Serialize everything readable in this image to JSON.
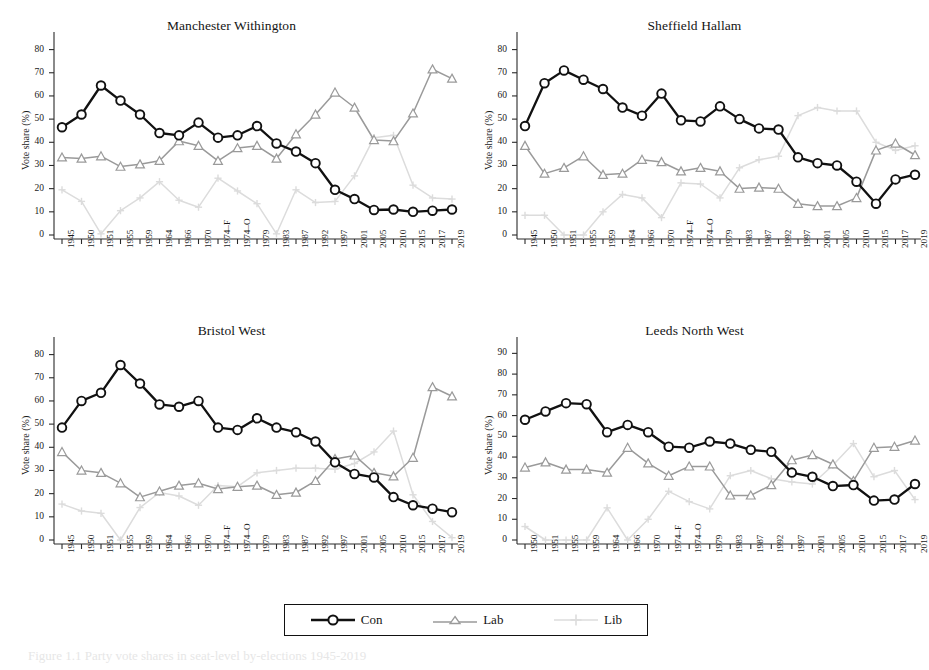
{
  "figure": {
    "caption": "Figure 1.1   Party vote shares in seat-level by-elections 1945-2019",
    "ylabel": "Vote share (%)"
  },
  "legend": {
    "position": "bottom-center",
    "entries": [
      {
        "label": "Con",
        "color": "#111111",
        "marker": "circle"
      },
      {
        "label": "Lab",
        "color": "#9a9a9a",
        "marker": "triangle"
      },
      {
        "label": "Lib",
        "color": "#dcdcdc",
        "marker": "plus"
      }
    ]
  },
  "chart_data": [
    {
      "type": "line",
      "title": "Manchester Withington",
      "xlabel": "",
      "ylabel": "Vote share (%)",
      "ylim": [
        0,
        85
      ],
      "yticks": [
        0,
        10,
        20,
        30,
        40,
        50,
        60,
        70,
        80
      ],
      "grid": false,
      "categories": [
        "1945",
        "1950",
        "1951",
        "1955",
        "1959",
        "1964",
        "1966",
        "1970",
        "1974–F",
        "1974–O",
        "1979",
        "1983",
        "1987",
        "1992",
        "1997",
        "2001",
        "2005",
        "2010",
        "2015",
        "2017",
        "2019"
      ],
      "series": [
        {
          "name": "Con",
          "color": "#111111",
          "marker": "circle",
          "values": [
            46.5,
            52.0,
            64.5,
            58.0,
            52.0,
            44.0,
            43.0,
            48.5,
            42.0,
            43.0,
            47.0,
            39.5,
            36.0,
            31.0,
            19.5,
            15.5,
            10.8,
            11.0,
            10.0,
            10.5,
            11.0
          ]
        },
        {
          "name": "Lab",
          "color": "#9a9a9a",
          "marker": "triangle",
          "values": [
            33.5,
            33.0,
            34.0,
            29.5,
            30.5,
            32.0,
            40.5,
            38.5,
            32.0,
            37.5,
            38.5,
            33.0,
            43.5,
            52.0,
            61.5,
            55.0,
            41.0,
            40.5,
            52.5,
            71.5,
            67.5
          ]
        },
        {
          "name": "Lib",
          "color": "#dcdcdc",
          "marker": "plus",
          "values": [
            19.5,
            14.5,
            0.5,
            10.5,
            16.0,
            23.0,
            15.0,
            12.0,
            24.5,
            19.0,
            13.5,
            0.5,
            19.5,
            14.0,
            14.5,
            25.5,
            42.0,
            43.0,
            21.5,
            16.0,
            15.5
          ]
        }
      ]
    },
    {
      "type": "line",
      "title": "Sheffield Hallam",
      "xlabel": "",
      "ylabel": "Vote share (%)",
      "ylim": [
        0,
        85
      ],
      "yticks": [
        0,
        10,
        20,
        30,
        40,
        50,
        60,
        70,
        80
      ],
      "grid": false,
      "categories": [
        "1945",
        "1950",
        "1951",
        "1955",
        "1959",
        "1964",
        "1966",
        "1970",
        "1974–F",
        "1974–O",
        "1979",
        "1983",
        "1987",
        "1992",
        "1997",
        "2001",
        "2005",
        "2010",
        "2015",
        "2017",
        "2019"
      ],
      "series": [
        {
          "name": "Con",
          "color": "#111111",
          "marker": "circle",
          "values": [
            47.0,
            65.5,
            71.0,
            67.0,
            63.0,
            55.0,
            51.5,
            61.0,
            49.5,
            49.0,
            55.5,
            50.0,
            46.0,
            45.5,
            33.5,
            31.0,
            30.0,
            23.0,
            13.5,
            24.0,
            26.0
          ]
        },
        {
          "name": "Lab",
          "color": "#9a9a9a",
          "marker": "triangle",
          "values": [
            38.5,
            26.5,
            29.0,
            34.0,
            26.0,
            26.5,
            32.5,
            31.5,
            27.5,
            29.0,
            27.5,
            20.0,
            20.5,
            20.0,
            13.5,
            12.5,
            12.5,
            16.0,
            36.5,
            39.5,
            34.5
          ]
        },
        {
          "name": "Lib",
          "color": "#dcdcdc",
          "marker": "plus",
          "values": [
            8.5,
            8.5,
            0.0,
            0.0,
            10.0,
            17.5,
            16.0,
            7.5,
            22.5,
            22.0,
            16.0,
            29.0,
            32.5,
            34.0,
            51.5,
            55.0,
            53.5,
            53.5,
            40.0,
            36.5,
            38.5
          ]
        }
      ]
    },
    {
      "type": "line",
      "title": "Bristol West",
      "xlabel": "",
      "ylabel": "Vote share (%)",
      "ylim": [
        0,
        85
      ],
      "yticks": [
        0,
        10,
        20,
        30,
        40,
        50,
        60,
        70,
        80
      ],
      "grid": false,
      "categories": [
        "1945",
        "1950",
        "1951",
        "1955",
        "1959",
        "1964",
        "1966",
        "1970",
        "1974–F",
        "1974–O",
        "1979",
        "1983",
        "1987",
        "1992",
        "1997",
        "2001",
        "2005",
        "2010",
        "2015",
        "2017",
        "2019"
      ],
      "series": [
        {
          "name": "Con",
          "color": "#111111",
          "marker": "circle",
          "values": [
            48.5,
            60.0,
            63.5,
            75.5,
            67.5,
            58.5,
            57.5,
            60.0,
            48.5,
            47.5,
            52.5,
            48.5,
            46.5,
            42.5,
            33.5,
            28.5,
            27.0,
            18.5,
            15.0,
            13.5,
            12.0
          ]
        },
        {
          "name": "Lab",
          "color": "#9a9a9a",
          "marker": "triangle",
          "values": [
            38.0,
            30.0,
            29.0,
            24.5,
            18.5,
            21.0,
            23.5,
            24.5,
            22.0,
            23.0,
            23.5,
            19.5,
            20.5,
            25.5,
            35.0,
            36.5,
            29.0,
            27.5,
            35.5,
            66.0,
            62.0
          ]
        },
        {
          "name": "Lib",
          "color": "#dcdcdc",
          "marker": "plus",
          "values": [
            15.5,
            12.5,
            11.5,
            0.0,
            14.0,
            20.5,
            19.0,
            15.0,
            23.5,
            23.0,
            29.0,
            30.0,
            31.0,
            31.0,
            30.5,
            33.0,
            38.0,
            47.0,
            19.5,
            8.0,
            1.0
          ]
        }
      ]
    },
    {
      "type": "line",
      "title": "Leeds North West",
      "xlabel": "",
      "ylabel": "Vote share (%)",
      "ylim": [
        0,
        95
      ],
      "yticks": [
        0,
        10,
        20,
        30,
        40,
        50,
        60,
        70,
        80,
        90
      ],
      "grid": false,
      "categories": [
        "1950",
        "1951",
        "1955",
        "1959",
        "1964",
        "1966",
        "1970",
        "1974–F",
        "1974–O",
        "1979",
        "1983",
        "1987",
        "1992",
        "1997",
        "2001",
        "2005",
        "2010",
        "2015",
        "2017",
        "2019"
      ],
      "series": [
        {
          "name": "Con",
          "color": "#111111",
          "marker": "circle",
          "values": [
            58.0,
            62.0,
            66.0,
            65.5,
            52.0,
            55.5,
            52.0,
            45.0,
            44.5,
            47.5,
            46.5,
            43.5,
            42.5,
            32.5,
            30.5,
            26.0,
            26.5,
            19.0,
            19.5,
            27.0
          ]
        },
        {
          "name": "Lab",
          "color": "#9a9a9a",
          "marker": "triangle",
          "values": [
            35.0,
            37.5,
            34.0,
            34.0,
            32.5,
            44.5,
            37.0,
            31.0,
            35.5,
            35.5,
            21.5,
            21.5,
            26.5,
            38.5,
            41.0,
            36.5,
            28.5,
            44.5,
            45.0,
            48.0
          ]
        },
        {
          "name": "Lib",
          "color": "#dcdcdc",
          "marker": "plus",
          "values": [
            6.5,
            0.0,
            0.0,
            0.0,
            15.5,
            0.0,
            10.0,
            23.5,
            18.5,
            15.0,
            31.0,
            33.5,
            29.5,
            28.0,
            27.0,
            36.0,
            46.5,
            30.5,
            33.5,
            19.5
          ]
        }
      ]
    }
  ]
}
